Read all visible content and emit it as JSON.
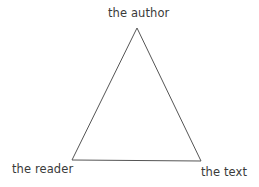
{
  "diagram": {
    "type": "triangle",
    "stroke_color": "#555555",
    "vertices": {
      "top": {
        "label": "the author",
        "x": 137,
        "y": 28
      },
      "bottom_left": {
        "label": "the reader",
        "x": 72,
        "y": 160
      },
      "bottom_right": {
        "label": "the text",
        "x": 201,
        "y": 161
      }
    }
  }
}
